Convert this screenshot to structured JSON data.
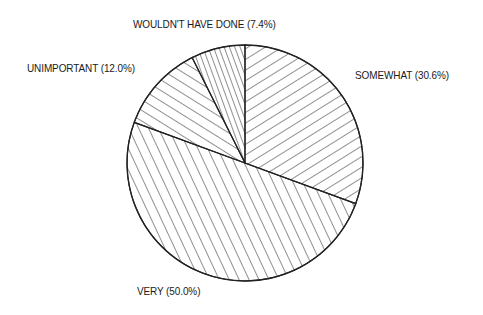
{
  "chart_data": {
    "type": "pie",
    "title": "",
    "slices": [
      {
        "label": "SOMEWHAT",
        "value": 30.6,
        "display": "SOMEWHAT (30.6%)",
        "pattern": "hatch-down-right"
      },
      {
        "label": "VERY",
        "value": 50.0,
        "display": "VERY (50.0%)",
        "pattern": "hatch-steep"
      },
      {
        "label": "UNIMPORTANT",
        "value": 12.0,
        "display": "UNIMPORTANT (12.0%)",
        "pattern": "hatch-shallow"
      },
      {
        "label": "WOULDN'T HAVE DONE",
        "value": 7.4,
        "display": "WOULDN'T HAVE DONE (7.4%)",
        "pattern": "hatch-near-vertical"
      }
    ],
    "categories": [
      "SOMEWHAT",
      "VERY",
      "UNIMPORTANT",
      "WOULDN'T HAVE DONE"
    ],
    "values": [
      30.6,
      50.0,
      12.0,
      7.4
    ],
    "start_angle_deg": 0,
    "direction": "clockwise",
    "legend": "none (direct labels)",
    "colors": {
      "stroke": "#222222",
      "background": "#ffffff"
    }
  },
  "labels": {
    "wouldnt": "WOULDN'T HAVE DONE (7.4%)",
    "unimportant": "UNIMPORTANT (12.0%)",
    "somewhat": "SOMEWHAT (30.6%)",
    "very": "VERY (50.0%)"
  }
}
